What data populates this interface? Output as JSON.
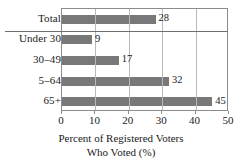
{
  "chart_data": {
    "type": "bar",
    "orientation": "horizontal",
    "title": "",
    "xlabel_lines": [
      "Percent of Registered Voters",
      "Who Voted (%)"
    ],
    "ylabel": "",
    "categories": [
      "Total",
      "Under 30",
      "30–49",
      "5–64",
      "65+"
    ],
    "values": [
      28,
      9,
      17,
      32,
      45
    ],
    "value_labels": [
      "28",
      "9",
      "17",
      "32",
      "45"
    ],
    "xlim": [
      0,
      50
    ],
    "xticks": [
      0,
      10,
      20,
      30,
      40,
      50
    ],
    "xtick_labels": [
      "0",
      "10",
      "20",
      "30",
      "40",
      "50"
    ],
    "grid": "vertical-gridlines-at-xticks",
    "legend": "none",
    "separator_after_category": "Total",
    "colors": {
      "bar": "#787878",
      "gridline": "#b9b9b9",
      "frame": "#8c8c8c",
      "separator": "#6f6f6f",
      "text": "#1a1a1a",
      "background": "#ffffff"
    }
  }
}
